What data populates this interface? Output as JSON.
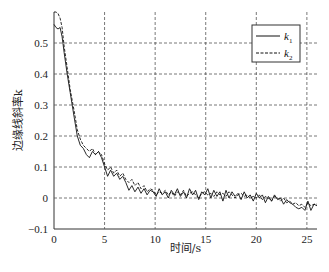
{
  "chart_data": {
    "type": "line",
    "title": "",
    "xlabel": "时间/s",
    "ylabel": "边缘线斜率k",
    "xlim": [
      0,
      26
    ],
    "ylim": [
      -0.1,
      0.6
    ],
    "xticks": [
      0,
      5,
      10,
      15,
      20,
      25
    ],
    "yticks": [
      -0.1,
      0,
      0.1,
      0.2,
      0.3,
      0.4,
      0.5
    ],
    "ytick_labels": [
      "−0.1",
      "0",
      "0.1",
      "0.2",
      "0.3",
      "0.4",
      "0.5"
    ],
    "xtick_labels": [
      "0",
      "5",
      "10",
      "15",
      "20",
      "25"
    ],
    "grid": true,
    "grid_style": "dashed",
    "legend_position": "upper right",
    "series": [
      {
        "name": "k1",
        "label_main": "k",
        "label_sub": "1",
        "style": "solid",
        "x": [
          0,
          0.2,
          0.4,
          0.6,
          0.8,
          1.0,
          1.3,
          1.6,
          2.0,
          2.3,
          2.6,
          2.9,
          3.2,
          3.5,
          3.8,
          4.1,
          4.4,
          4.7,
          5.0,
          5.3,
          5.6,
          5.9,
          6.2,
          6.5,
          6.8,
          7.1,
          7.4,
          7.7,
          8.0,
          8.3,
          8.6,
          8.9,
          9.2,
          9.5,
          9.8,
          10.1,
          10.4,
          10.7,
          11.0,
          11.3,
          11.6,
          11.9,
          12.2,
          12.5,
          12.8,
          13.1,
          13.4,
          13.7,
          14.0,
          14.3,
          14.6,
          14.9,
          15.2,
          15.5,
          15.8,
          16.1,
          16.4,
          16.7,
          17.0,
          17.3,
          17.6,
          17.9,
          18.2,
          18.5,
          18.8,
          19.1,
          19.4,
          19.7,
          20.0,
          20.3,
          20.6,
          20.9,
          21.2,
          21.5,
          21.8,
          22.1,
          22.4,
          22.7,
          23.0,
          23.3,
          23.6,
          23.9,
          24.2,
          24.5,
          24.8,
          25.1,
          25.4,
          25.7,
          26.0
        ],
        "y": [
          0.56,
          0.55,
          0.545,
          0.55,
          0.52,
          0.47,
          0.4,
          0.34,
          0.26,
          0.2,
          0.17,
          0.16,
          0.14,
          0.13,
          0.15,
          0.14,
          0.15,
          0.13,
          0.1,
          0.07,
          0.09,
          0.07,
          0.08,
          0.06,
          0.07,
          0.05,
          0.025,
          0.04,
          0.02,
          0.035,
          0.015,
          0.03,
          0.01,
          0.025,
          0.02,
          0.005,
          0.03,
          0.01,
          0.02,
          0.0,
          0.025,
          0.01,
          0.03,
          0.005,
          0.02,
          0.0,
          0.03,
          0.01,
          0.025,
          -0.005,
          0.02,
          0.01,
          0.03,
          0.0,
          0.025,
          0.005,
          0.02,
          -0.01,
          0.025,
          0.0,
          0.02,
          0.005,
          0.015,
          -0.005,
          0.02,
          0.0,
          0.01,
          -0.01,
          0.015,
          0.0,
          0.01,
          -0.015,
          0.005,
          -0.01,
          0.01,
          -0.005,
          0.0,
          -0.02,
          -0.005,
          -0.015,
          -0.02,
          -0.03,
          -0.035,
          -0.03,
          -0.04,
          -0.01,
          -0.04,
          -0.02,
          -0.025
        ]
      },
      {
        "name": "k2",
        "label_main": "k",
        "label_sub": "2",
        "style": "dashed",
        "x": [
          0,
          0.2,
          0.4,
          0.6,
          0.8,
          1.0,
          1.3,
          1.6,
          2.0,
          2.3,
          2.6,
          2.9,
          3.2,
          3.5,
          3.8,
          4.1,
          4.4,
          4.7,
          5.0,
          5.3,
          5.6,
          5.9,
          6.2,
          6.5,
          6.8,
          7.1,
          7.4,
          7.7,
          8.0,
          8.3,
          8.6,
          8.9,
          9.2,
          9.5,
          9.8,
          10.1,
          10.4,
          10.7,
          11.0,
          11.3,
          11.6,
          11.9,
          12.2,
          12.5,
          12.8,
          13.1,
          13.4,
          13.7,
          14.0,
          14.3,
          14.6,
          14.9,
          15.2,
          15.5,
          15.8,
          16.1,
          16.4,
          16.7,
          17.0,
          17.3,
          17.6,
          17.9,
          18.2,
          18.5,
          18.8,
          19.1,
          19.4,
          19.7,
          20.0,
          20.3,
          20.6,
          20.9,
          21.2,
          21.5,
          21.8,
          22.1,
          22.4,
          22.7,
          23.0,
          23.3,
          23.6,
          23.9,
          24.2,
          24.5,
          24.8,
          25.1,
          25.4,
          25.7,
          26.0
        ],
        "y": [
          0.6,
          0.6,
          0.595,
          0.58,
          0.55,
          0.49,
          0.42,
          0.35,
          0.28,
          0.22,
          0.19,
          0.17,
          0.16,
          0.15,
          0.16,
          0.14,
          0.15,
          0.14,
          0.11,
          0.09,
          0.1,
          0.08,
          0.09,
          0.07,
          0.08,
          0.06,
          0.05,
          0.06,
          0.04,
          0.05,
          0.03,
          0.04,
          0.02,
          0.03,
          0.025,
          0.01,
          0.02,
          0.015,
          0.025,
          0.01,
          0.02,
          0.005,
          0.02,
          0.01,
          0.025,
          0.005,
          0.015,
          0.02,
          0.01,
          0.0,
          0.015,
          0.02,
          0.01,
          0.015,
          0.005,
          0.02,
          0.01,
          0.015,
          0.005,
          0.02,
          0.01,
          0.0,
          0.01,
          0.015,
          0.005,
          0.01,
          0.0,
          0.005,
          0.0,
          0.01,
          -0.005,
          0.005,
          0.0,
          -0.01,
          0.005,
          0.0,
          -0.01,
          0.0,
          -0.015,
          -0.01,
          -0.02,
          -0.015,
          -0.025,
          -0.02,
          -0.03,
          -0.015,
          -0.025,
          -0.02,
          -0.02
        ]
      }
    ]
  }
}
